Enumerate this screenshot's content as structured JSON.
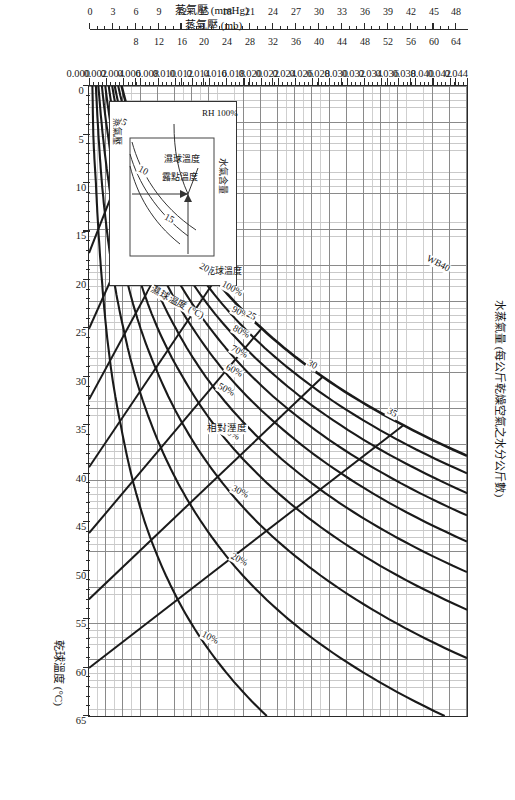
{
  "figure": {
    "kind": "psychrometric-chart",
    "orientation_note": "landscape chart printed rotated 90 degrees"
  },
  "axes": {
    "dry_bulb": {
      "title": "乾球溫度 (°C)",
      "ticks": [
        0,
        5,
        10,
        15,
        20,
        25,
        30,
        35,
        40,
        45,
        50,
        55,
        60,
        65
      ],
      "min": 0,
      "max": 65
    },
    "humidity_ratio": {
      "title": "水蒸氣量 (每公斤乾燥空氣之水分公斤數)",
      "ticks": [
        "0.000",
        "0.002",
        "0.004",
        "0.006",
        "0.008",
        "0.010",
        "0.012",
        "0.014",
        "0.016",
        "0.018",
        "0.020",
        "0.022",
        "0.024",
        "0.026",
        "0.028",
        "0.030",
        "0.032",
        "0.034",
        "0.036",
        "0.038",
        "0.040",
        "0.042",
        "0.044"
      ],
      "min": 0.0,
      "max": 0.044
    },
    "vapor_pressure_mb": {
      "title": "蒸氣壓 (mb)",
      "ticks": [
        8,
        12,
        16,
        20,
        24,
        28,
        32,
        36,
        40,
        44,
        48,
        52,
        56,
        60,
        64
      ],
      "min": 0,
      "max": 66
    },
    "vapor_pressure_mmhg": {
      "title": "蒸氣壓 (mmHg)",
      "ticks": [
        0,
        3,
        6,
        9,
        12,
        15,
        18,
        21,
        24,
        27,
        30,
        33,
        36,
        39,
        42,
        45,
        48
      ],
      "min": 0,
      "max": 49.5
    }
  },
  "chart_data": {
    "type": "line",
    "title": "水蒸氣量 (每公斤乾燥空氣之水分公斤數)",
    "xlabel": "乾球溫度 (°C)",
    "ylabel": "水蒸氣量 (每公斤乾燥空氣之水分公斤數)",
    "xlim": [
      0,
      65
    ],
    "ylim": [
      0.0,
      0.044
    ],
    "grid": true,
    "legend": "none",
    "series": [
      {
        "name": "RH 100% (飽和曲線)",
        "label": "100%",
        "x": [
          0,
          5,
          10,
          15,
          20,
          25,
          30,
          35,
          40,
          45
        ],
        "y": [
          0.0038,
          0.0054,
          0.0076,
          0.0106,
          0.0147,
          0.0201,
          0.0272,
          0.0366,
          0.049,
          0.0654
        ]
      },
      {
        "name": "RH 90%",
        "label": "90%",
        "x": [
          0,
          5,
          10,
          15,
          20,
          25,
          30,
          35,
          40,
          45
        ],
        "y": [
          0.0034,
          0.0049,
          0.0069,
          0.0096,
          0.0133,
          0.0181,
          0.0245,
          0.0329,
          0.0441,
          0.0588
        ]
      },
      {
        "name": "RH 80%",
        "label": "80%",
        "x": [
          0,
          5,
          10,
          15,
          20,
          25,
          30,
          35,
          40,
          45,
          50
        ],
        "y": [
          0.003,
          0.0043,
          0.0061,
          0.0085,
          0.0118,
          0.0161,
          0.0218,
          0.0293,
          0.0392,
          0.0523,
          0.0697
        ]
      },
      {
        "name": "RH 70%",
        "label": "70%",
        "x": [
          0,
          5,
          10,
          15,
          20,
          25,
          30,
          35,
          40,
          45,
          50
        ],
        "y": [
          0.0027,
          0.0038,
          0.0053,
          0.0074,
          0.0103,
          0.0141,
          0.019,
          0.0256,
          0.0343,
          0.0458,
          0.061
        ]
      },
      {
        "name": "RH 60%",
        "label": "60%",
        "x": [
          0,
          5,
          10,
          15,
          20,
          25,
          30,
          35,
          40,
          45,
          50,
          55
        ],
        "y": [
          0.0023,
          0.0032,
          0.0046,
          0.0064,
          0.0088,
          0.0121,
          0.0163,
          0.022,
          0.0294,
          0.0392,
          0.0523,
          0.0697
        ]
      },
      {
        "name": "RH 50%",
        "label": "50%",
        "x": [
          0,
          5,
          10,
          15,
          20,
          25,
          30,
          35,
          40,
          45,
          50,
          55
        ],
        "y": [
          0.0019,
          0.0027,
          0.0038,
          0.0053,
          0.0074,
          0.0101,
          0.0136,
          0.0183,
          0.0245,
          0.0327,
          0.0436,
          0.0581
        ]
      },
      {
        "name": "RH 40%",
        "label": "40%",
        "x": [
          0,
          5,
          10,
          15,
          20,
          25,
          30,
          35,
          40,
          45,
          50,
          55,
          60
        ],
        "y": [
          0.0015,
          0.0022,
          0.0031,
          0.0043,
          0.0059,
          0.008,
          0.0109,
          0.0146,
          0.0196,
          0.0262,
          0.0349,
          0.0465,
          0.062
        ]
      },
      {
        "name": "RH 30%",
        "label": "30%",
        "x": [
          0,
          5,
          10,
          15,
          20,
          25,
          30,
          35,
          40,
          45,
          50,
          55,
          60,
          65
        ],
        "y": [
          0.0011,
          0.0016,
          0.0023,
          0.0032,
          0.0044,
          0.006,
          0.0082,
          0.011,
          0.0147,
          0.0196,
          0.0262,
          0.0349,
          0.0465,
          0.062
        ]
      },
      {
        "name": "RH 20%",
        "label": "20%",
        "x": [
          0,
          5,
          10,
          15,
          20,
          25,
          30,
          35,
          40,
          45,
          50,
          55,
          60,
          65
        ],
        "y": [
          0.0008,
          0.0011,
          0.0015,
          0.0021,
          0.0029,
          0.004,
          0.0054,
          0.0073,
          0.0098,
          0.0131,
          0.0174,
          0.0232,
          0.031,
          0.0414
        ]
      },
      {
        "name": "RH 10%",
        "label": "10%",
        "x": [
          0,
          5,
          10,
          15,
          20,
          25,
          30,
          35,
          40,
          45,
          50,
          55,
          60,
          65
        ],
        "y": [
          0.0004,
          0.0005,
          0.0008,
          0.0011,
          0.0015,
          0.002,
          0.0027,
          0.0037,
          0.0049,
          0.0065,
          0.0087,
          0.0116,
          0.0155,
          0.0207
        ]
      }
    ],
    "wet_bulb_lines": {
      "name": "濕球溫度 (°C)",
      "label": "濕球溫度 (°C)",
      "values": [
        5,
        10,
        15,
        20,
        25,
        30,
        35,
        40
      ],
      "labeled": [
        "5",
        "10",
        "15",
        "20",
        "25",
        "30",
        "35",
        "WB40"
      ]
    },
    "annotations": [
      {
        "text": "相對溼度",
        "meaning": "relative humidity family label"
      },
      {
        "text": "濕球溫度 (°C)",
        "meaning": "wet bulb temperature family label"
      },
      {
        "text": "WB40",
        "meaning": "wet bulb 40 C line"
      },
      {
        "text": "100%",
        "meaning": "saturation line"
      }
    ]
  },
  "rh_labels": [
    "10%",
    "20%",
    "30%",
    "40%",
    "50%",
    "60%",
    "70%",
    "80%",
    "90%",
    "100%"
  ],
  "wetbulb_labels": [
    "5",
    "10",
    "15",
    "20",
    "25",
    "30",
    "35",
    "WB40"
  ],
  "annotations": {
    "relative_humidity": "相對溼度",
    "wet_bulb_family": "濕球溫度 (°C)",
    "wb40": "WB40",
    "saturation": "100%"
  },
  "inset": {
    "moisture_content": "水氣含量",
    "rh100": "RH 100%",
    "wet_bulb": "濕球溫度",
    "dew_point": "露點溫度",
    "dry_bulb": "乾球溫度",
    "vapor_pressure": "蒸氣壓"
  },
  "colors": {
    "line": "#1a1a1a",
    "grid_minor": "#cacaca",
    "grid_major": "#8a8a8a",
    "frame": "#2a2a2a",
    "background": "#ffffff"
  }
}
